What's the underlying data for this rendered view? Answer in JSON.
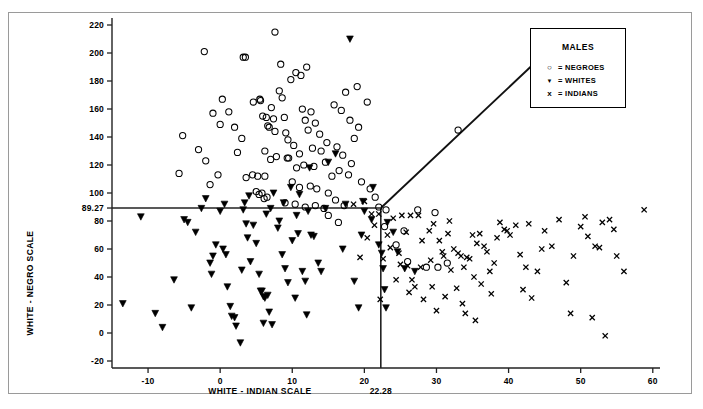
{
  "legend": {
    "title": "MALES",
    "entries": [
      {
        "marker": "circle",
        "glyph": "○",
        "text": "= NEGROES",
        "label": "NEGROES"
      },
      {
        "marker": "triangle-down",
        "glyph": "▼",
        "text": "= WHITES",
        "label": "WHITES"
      },
      {
        "marker": "x",
        "glyph": "x",
        "text": "= INDIANS",
        "label": "INDIANS"
      }
    ]
  },
  "axes": {
    "x_title": "WHITE - INDIAN SCALE",
    "y_title": "WHITE - NEGRO SCALE",
    "x_ticks": [
      -10,
      0,
      10,
      20,
      30,
      40,
      50,
      60
    ],
    "y_ticks": [
      -20,
      0,
      20,
      40,
      60,
      80,
      100,
      120,
      140,
      160,
      180,
      200,
      220
    ],
    "x_cut_label": "22.28",
    "y_cut_label": "89.27"
  },
  "chart_data": {
    "type": "scatter",
    "title": "MALES",
    "xlabel": "WHITE - INDIAN SCALE",
    "ylabel": "WHITE - NEGRO SCALE",
    "xlim": [
      -15,
      61
    ],
    "ylim": [
      -25,
      225
    ],
    "grid": false,
    "legend_position": "top-right",
    "annotations": {
      "x_cutoff": 22.28,
      "y_cutoff": 89.27,
      "horizontal_line": {
        "y": 89.27,
        "x_from": -15,
        "x_to": 22.28
      },
      "vertical_line": {
        "x": 22.28,
        "y_from": -25,
        "y_to": 89.27
      },
      "diagonal_line": {
        "x_from": 22.28,
        "y_from": 89.27,
        "x_to": 45.2,
        "y_to": 200.5
      }
    },
    "series": [
      {
        "name": "NEGROES",
        "marker": "circle",
        "points": [
          [
            -5.7,
            114
          ],
          [
            -5.2,
            141
          ],
          [
            -3.0,
            131
          ],
          [
            -2.0,
            123
          ],
          [
            0.3,
            167
          ],
          [
            -1.0,
            157
          ],
          [
            0.0,
            149
          ],
          [
            1.2,
            158
          ],
          [
            -1.4,
            106
          ],
          [
            -0.3,
            113
          ],
          [
            2.4,
            129
          ],
          [
            2.0,
            147
          ],
          [
            3.0,
            139
          ],
          [
            4.6,
            165
          ],
          [
            5.5,
            167
          ],
          [
            5.6,
            166
          ],
          [
            5.9,
            155
          ],
          [
            6.4,
            154
          ],
          [
            6.6,
            148
          ],
          [
            6.8,
            147
          ],
          [
            7.1,
            161
          ],
          [
            7.4,
            153
          ],
          [
            7.6,
            144
          ],
          [
            8.2,
            173
          ],
          [
            8.6,
            168
          ],
          [
            8.9,
            154
          ],
          [
            9.1,
            143
          ],
          [
            9.4,
            138
          ],
          [
            6.2,
            130
          ],
          [
            7.0,
            124
          ],
          [
            7.8,
            126
          ],
          [
            9.3,
            125
          ],
          [
            9.5,
            125
          ],
          [
            3.6,
            111
          ],
          [
            4.5,
            113
          ],
          [
            5.2,
            112
          ],
          [
            6.2,
            112
          ],
          [
            5.0,
            101
          ],
          [
            5.4,
            99
          ],
          [
            5.8,
            100
          ],
          [
            6.1,
            96
          ],
          [
            6.5,
            97
          ],
          [
            3.2,
            197
          ],
          [
            3.5,
            197
          ],
          [
            7.6,
            215
          ],
          [
            -2.2,
            201
          ],
          [
            10.5,
            186
          ],
          [
            11.2,
            184
          ],
          [
            12.0,
            190
          ],
          [
            11.4,
            160
          ],
          [
            11.8,
            152
          ],
          [
            12.6,
            158
          ],
          [
            13.2,
            150
          ],
          [
            12.2,
            145
          ],
          [
            13.8,
            142
          ],
          [
            10.2,
            134
          ],
          [
            11.0,
            128
          ],
          [
            12.8,
            132
          ],
          [
            14.0,
            130
          ],
          [
            10.6,
            118
          ],
          [
            11.6,
            120
          ],
          [
            13.0,
            119
          ],
          [
            14.6,
            122
          ],
          [
            10.0,
            108
          ],
          [
            11.0,
            104
          ],
          [
            12.5,
            105
          ],
          [
            13.4,
            103
          ],
          [
            15.0,
            100
          ],
          [
            9.0,
            93
          ],
          [
            10.4,
            92
          ],
          [
            11.8,
            90
          ],
          [
            13.2,
            91
          ],
          [
            14.4,
            89
          ],
          [
            16.0,
            95
          ],
          [
            17.2,
            91
          ],
          [
            15.5,
            112
          ],
          [
            16.5,
            116
          ],
          [
            17.8,
            113
          ],
          [
            14.8,
            136
          ],
          [
            16.2,
            133
          ],
          [
            17.0,
            127
          ],
          [
            15.8,
            163
          ],
          [
            16.8,
            159
          ],
          [
            18.0,
            152
          ],
          [
            19.2,
            147
          ],
          [
            18.6,
            139
          ],
          [
            17.4,
            172
          ],
          [
            19.0,
            176
          ],
          [
            20.4,
            165
          ],
          [
            18.2,
            121
          ],
          [
            19.6,
            108
          ],
          [
            20.8,
            103
          ],
          [
            21.5,
            97
          ],
          [
            22.0,
            90
          ],
          [
            23.0,
            88
          ],
          [
            8.4,
            192
          ],
          [
            9.8,
            181
          ],
          [
            24.4,
            63
          ],
          [
            26.0,
            51
          ],
          [
            28.6,
            47
          ],
          [
            30.2,
            47
          ],
          [
            27.4,
            88
          ],
          [
            29.8,
            86
          ],
          [
            15.0,
            84
          ],
          [
            16.4,
            79
          ],
          [
            22.8,
            76
          ],
          [
            25.5,
            73
          ],
          [
            31.5,
            50
          ],
          [
            33.0,
            145
          ]
        ]
      },
      {
        "name": "WHITES",
        "marker": "triangle-down",
        "points": [
          [
            -13.5,
            21
          ],
          [
            -11.0,
            83
          ],
          [
            -9.0,
            14
          ],
          [
            -8.0,
            4
          ],
          [
            -6.4,
            38
          ],
          [
            -5.0,
            81
          ],
          [
            -4.5,
            79
          ],
          [
            -4.0,
            18
          ],
          [
            -3.4,
            72
          ],
          [
            -2.0,
            96
          ],
          [
            -1.0,
            55
          ],
          [
            -1.4,
            50
          ],
          [
            -0.6,
            63
          ],
          [
            -1.2,
            42
          ],
          [
            0.0,
            87
          ],
          [
            0.8,
            56
          ],
          [
            0.4,
            60
          ],
          [
            1.0,
            33
          ],
          [
            1.6,
            12
          ],
          [
            2.0,
            11
          ],
          [
            2.2,
            5
          ],
          [
            1.4,
            19
          ],
          [
            2.8,
            -7
          ],
          [
            3.0,
            45
          ],
          [
            3.6,
            78
          ],
          [
            3.8,
            68
          ],
          [
            3.2,
            88
          ],
          [
            4.2,
            51
          ],
          [
            4.6,
            77
          ],
          [
            5.0,
            64
          ],
          [
            5.6,
            30
          ],
          [
            5.8,
            30
          ],
          [
            6.0,
            26
          ],
          [
            6.2,
            25
          ],
          [
            6.6,
            27
          ],
          [
            6.0,
            7
          ],
          [
            6.8,
            15
          ],
          [
            7.2,
            6
          ],
          [
            5.4,
            42
          ],
          [
            4.0,
            98
          ],
          [
            6.4,
            85
          ],
          [
            7.0,
            89
          ],
          [
            8.0,
            75
          ],
          [
            8.6,
            56
          ],
          [
            9.0,
            46
          ],
          [
            9.4,
            36
          ],
          [
            8.2,
            80
          ],
          [
            10.0,
            66
          ],
          [
            10.4,
            25
          ],
          [
            10.8,
            71
          ],
          [
            11.4,
            44
          ],
          [
            11.8,
            37
          ],
          [
            12.0,
            13
          ],
          [
            12.6,
            70
          ],
          [
            13.0,
            69
          ],
          [
            12.2,
            87
          ],
          [
            9.8,
            104
          ],
          [
            11.0,
            99
          ],
          [
            13.6,
            50
          ],
          [
            14.0,
            44
          ],
          [
            15.0,
            122
          ],
          [
            12.4,
            118
          ],
          [
            16.0,
            128
          ],
          [
            18.0,
            210
          ],
          [
            19.2,
            18
          ],
          [
            20.0,
            87
          ],
          [
            21.0,
            81
          ],
          [
            22.0,
            63
          ],
          [
            22.4,
            57
          ],
          [
            22.6,
            46
          ],
          [
            22.8,
            31
          ],
          [
            23.0,
            18
          ],
          [
            23.2,
            79
          ],
          [
            24.0,
            72
          ],
          [
            24.6,
            58
          ],
          [
            25.6,
            46
          ],
          [
            27.0,
            44
          ],
          [
            8.8,
            93
          ],
          [
            3.4,
            93
          ],
          [
            0.6,
            92
          ],
          [
            -2.6,
            89
          ],
          [
            14.6,
            89
          ],
          [
            17.4,
            92
          ],
          [
            19.8,
            94
          ],
          [
            21.2,
            104
          ],
          [
            7.4,
            100
          ],
          [
            10.6,
            84
          ],
          [
            17.0,
            60
          ],
          [
            18.6,
            37
          ],
          [
            19.6,
            70
          ]
        ]
      },
      {
        "name": "INDIANS",
        "marker": "x",
        "points": [
          [
            18.5,
            92
          ],
          [
            20.0,
            94
          ],
          [
            21.0,
            85
          ],
          [
            22.0,
            85
          ],
          [
            22.6,
            53
          ],
          [
            23.2,
            70
          ],
          [
            24.0,
            82
          ],
          [
            25.2,
            84
          ],
          [
            26.4,
            84
          ],
          [
            27.5,
            84
          ],
          [
            23.6,
            61
          ],
          [
            24.8,
            57
          ],
          [
            25.0,
            49
          ],
          [
            26.0,
            48
          ],
          [
            26.6,
            38
          ],
          [
            27.0,
            33
          ],
          [
            28.0,
            66
          ],
          [
            29.0,
            73
          ],
          [
            29.6,
            78
          ],
          [
            30.4,
            66
          ],
          [
            30.8,
            58
          ],
          [
            31.0,
            55
          ],
          [
            31.6,
            71
          ],
          [
            32.0,
            45
          ],
          [
            32.4,
            60
          ],
          [
            33.0,
            57
          ],
          [
            33.4,
            55
          ],
          [
            33.8,
            47
          ],
          [
            34.2,
            54
          ],
          [
            34.6,
            53
          ],
          [
            35.0,
            70
          ],
          [
            35.6,
            64
          ],
          [
            35.2,
            40
          ],
          [
            36.0,
            71
          ],
          [
            36.6,
            62
          ],
          [
            37.0,
            58
          ],
          [
            37.4,
            44
          ],
          [
            38.0,
            50
          ],
          [
            38.4,
            68
          ],
          [
            38.8,
            79
          ],
          [
            39.4,
            74
          ],
          [
            39.8,
            73
          ],
          [
            40.2,
            70
          ],
          [
            41.0,
            77
          ],
          [
            41.6,
            56
          ],
          [
            42.0,
            31
          ],
          [
            42.4,
            47
          ],
          [
            42.8,
            78
          ],
          [
            43.2,
            25
          ],
          [
            44.0,
            44
          ],
          [
            32.8,
            32
          ],
          [
            31.2,
            26
          ],
          [
            33.6,
            21
          ],
          [
            34.0,
            14
          ],
          [
            35.4,
            9
          ],
          [
            36.2,
            35
          ],
          [
            37.6,
            28
          ],
          [
            29.4,
            33
          ],
          [
            28.2,
            24
          ],
          [
            30.0,
            16
          ],
          [
            45.0,
            73
          ],
          [
            46.0,
            62
          ],
          [
            47.0,
            81
          ],
          [
            48.0,
            36
          ],
          [
            49.0,
            55
          ],
          [
            50.0,
            76
          ],
          [
            50.6,
            83
          ],
          [
            51.0,
            69
          ],
          [
            52.0,
            62
          ],
          [
            52.6,
            61
          ],
          [
            53.0,
            79
          ],
          [
            54.0,
            81
          ],
          [
            54.6,
            74
          ],
          [
            55.0,
            55
          ],
          [
            56.0,
            44
          ],
          [
            51.6,
            11
          ],
          [
            53.4,
            -2
          ],
          [
            48.6,
            14
          ],
          [
            58.8,
            88
          ],
          [
            44.6,
            60
          ],
          [
            21.4,
            77
          ],
          [
            20.4,
            68
          ],
          [
            19.4,
            54
          ],
          [
            22.2,
            24
          ],
          [
            24.4,
            38
          ],
          [
            25.8,
            72
          ],
          [
            27.8,
            47
          ],
          [
            29.2,
            52
          ],
          [
            31.8,
            80
          ],
          [
            26.2,
            29
          ]
        ]
      }
    ]
  }
}
